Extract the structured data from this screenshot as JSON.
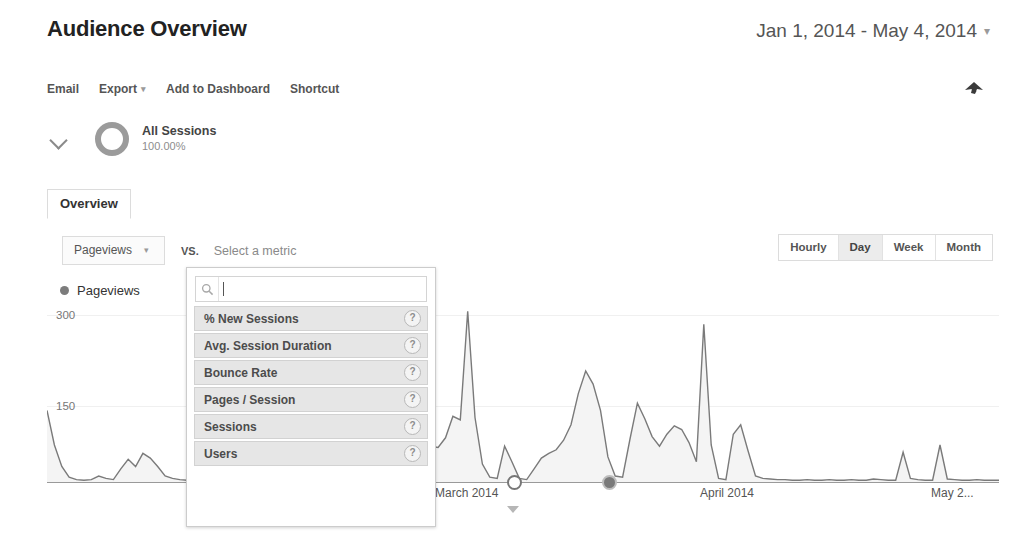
{
  "header": {
    "title": "Audience Overview",
    "date_range": "Jan 1, 2014 - May 4, 2014",
    "date_caret": "▾"
  },
  "toolbar": {
    "items": [
      {
        "label": "Email",
        "caret": ""
      },
      {
        "label": "Export",
        "caret": "▾"
      },
      {
        "label": "Add to Dashboard",
        "caret": ""
      },
      {
        "label": "Shortcut",
        "caret": ""
      }
    ],
    "share_icon": "share-icon"
  },
  "segment": {
    "chevron_icon": "chevron-down-icon",
    "donut_icon": "segment-donut-icon",
    "name": "All Sessions",
    "percent": "100.00%"
  },
  "tabs": [
    {
      "label": "Overview",
      "active": true
    }
  ],
  "metric_controls": {
    "primary_metric": "Pageviews",
    "primary_caret": "▾",
    "vs_label": "VS.",
    "secondary_placeholder": "Select a metric"
  },
  "granularity": {
    "options": [
      "Hourly",
      "Day",
      "Week",
      "Month"
    ],
    "selected": "Day"
  },
  "metric_dropdown": {
    "search_value": "",
    "search_placeholder": "",
    "search_icon": "search-icon",
    "items": [
      {
        "label": "% New Sessions",
        "help": "?"
      },
      {
        "label": "Avg. Session Duration",
        "help": "?"
      },
      {
        "label": "Bounce Rate",
        "help": "?"
      },
      {
        "label": "Pages / Session",
        "help": "?"
      },
      {
        "label": "Sessions",
        "help": "?"
      },
      {
        "label": "Users",
        "help": "?"
      }
    ]
  },
  "chart_data": {
    "type": "line",
    "title": "",
    "legend": [
      "Pageviews"
    ],
    "legend_position": "top-left",
    "xlabel": "",
    "ylabel": "",
    "ylim": [
      0,
      330
    ],
    "yticks": [
      150,
      300
    ],
    "ytick_labels": [
      "150",
      "300"
    ],
    "grid": true,
    "xtick_labels": [
      "March 2014",
      "April 2014",
      "May 2..."
    ],
    "xtick_positions": [
      0.44,
      0.72,
      0.95
    ],
    "series": [
      {
        "name": "Pageviews",
        "color": "#7a7a7a",
        "fill": "#f2f2f2",
        "values": [
          120,
          62,
          26,
          8,
          4,
          3,
          4,
          10,
          6,
          4,
          22,
          38,
          26,
          48,
          40,
          26,
          10,
          6,
          4,
          3,
          3,
          4,
          3,
          3,
          4,
          3,
          3,
          4,
          3,
          3,
          4,
          3,
          3,
          4,
          3,
          3,
          4,
          5,
          4,
          3,
          3,
          4,
          3,
          3,
          4,
          3,
          3,
          4,
          6,
          18,
          10,
          34,
          60,
          58,
          74,
          110,
          104,
          286,
          108,
          30,
          8,
          6,
          60,
          34,
          6,
          4,
          22,
          40,
          48,
          54,
          70,
          96,
          148,
          186,
          164,
          120,
          42,
          10,
          8,
          72,
          132,
          106,
          76,
          60,
          80,
          94,
          88,
          66,
          34,
          264,
          62,
          6,
          4,
          80,
          96,
          52,
          10,
          6,
          5,
          4,
          4,
          3,
          3,
          4,
          3,
          3,
          4,
          3,
          3,
          4,
          3,
          3,
          5,
          4,
          3,
          3,
          50,
          6,
          4,
          3,
          3,
          62,
          5,
          4,
          3,
          3,
          4,
          3,
          3,
          3
        ]
      }
    ],
    "annotations": [
      {
        "type": "axis-marker",
        "style": "outline",
        "x_fraction": 0.4906
      },
      {
        "type": "axis-marker",
        "style": "filled",
        "x_fraction": 0.5907
      },
      {
        "type": "caret",
        "x_fraction": 0.49
      }
    ]
  }
}
